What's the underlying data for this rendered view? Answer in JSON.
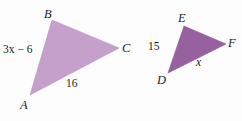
{
  "figure": {
    "kind": "similar-triangles-diagram",
    "background_color": "#fdfdfd",
    "text_color": "#231f20",
    "triangles": [
      {
        "name": "triangle-ABC",
        "fill_color": "#c5a0cb",
        "vertices": {
          "A": {
            "label": "A",
            "x": 30,
            "y": 95
          },
          "B": {
            "label": "B",
            "x": 52,
            "y": 20
          },
          "C": {
            "label": "C",
            "x": 119,
            "y": 48
          }
        },
        "sides": [
          {
            "name": "side-AB",
            "label": "3x − 6"
          },
          {
            "name": "side-AC",
            "label": "16"
          }
        ]
      },
      {
        "name": "triangle-DEF",
        "fill_color": "#97609f",
        "vertices": {
          "D": {
            "label": "D",
            "x": 168,
            "y": 73
          },
          "E": {
            "label": "E",
            "x": 184,
            "y": 26
          },
          "F": {
            "label": "F",
            "x": 226,
            "y": 44
          }
        },
        "sides": [
          {
            "name": "side-DE",
            "label": "15"
          },
          {
            "name": "side-DF",
            "label": "x"
          }
        ]
      }
    ]
  }
}
